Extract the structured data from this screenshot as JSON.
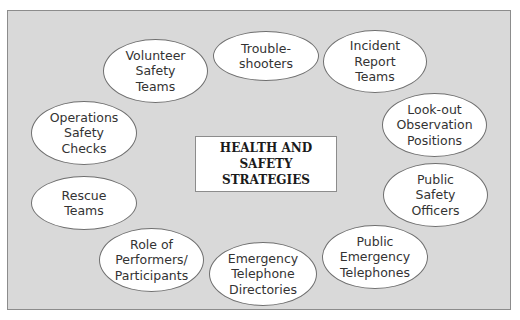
{
  "diagram": {
    "center_label": "HEALTH AND\nSAFETY STRATEGIES",
    "nodes": [
      {
        "id": "trouble-shooters",
        "label": "Trouble-\nshooters"
      },
      {
        "id": "incident-report-teams",
        "label": "Incident\nReport\nTeams"
      },
      {
        "id": "look-out-observation-positions",
        "label": "Look-out\nObservation\nPositions"
      },
      {
        "id": "public-safety-officers",
        "label": "Public\nSafety\nOfficers"
      },
      {
        "id": "public-emergency-telephones",
        "label": "Public\nEmergency\nTelephones"
      },
      {
        "id": "emergency-telephone-directories",
        "label": "Emergency\nTelephone\nDirectories"
      },
      {
        "id": "role-of-performers-participants",
        "label": "Role of\nPerformers/\nParticipants"
      },
      {
        "id": "rescue-teams",
        "label": "Rescue\nTeams"
      },
      {
        "id": "operations-safety-checks",
        "label": "Operations\nSafety\nChecks"
      },
      {
        "id": "volunteer-safety-teams",
        "label": "Volunteer\nSafety\nTeams"
      }
    ]
  }
}
